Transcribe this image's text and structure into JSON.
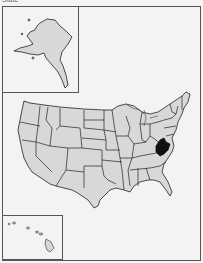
{
  "caption": "State",
  "map": {
    "title": "United States locator map",
    "highlighted_state": "West Virginia",
    "colors": {
      "state_fill": "#d8d8d8",
      "state_stroke": "#222222",
      "highlight_fill": "#111111",
      "background": "#f3f3f3",
      "frame": "#555555"
    },
    "insets": [
      "Alaska",
      "Hawaii"
    ]
  }
}
